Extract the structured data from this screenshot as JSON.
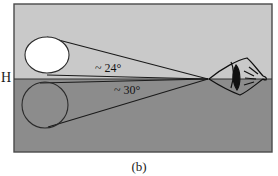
{
  "figure": {
    "caption": "(b)",
    "horizon_label": "H",
    "background_color": "#ffffff",
    "frame": {
      "x": 14,
      "y": 4,
      "width": 258,
      "height": 148,
      "border_color": "#4a4a4a",
      "sky_color": "#c9c9c9",
      "ground_color": "#8c8c8c"
    },
    "horizon": {
      "y": 79,
      "line_color": "#3a3a3a"
    },
    "vertex": {
      "x": 208,
      "y": 79
    }
  },
  "moons": {
    "zenith_moon": {
      "name": "elevated-moon",
      "cx": 47,
      "cy": 55,
      "rx": 22,
      "ry": 18,
      "fill": "#ffffff",
      "stroke": "#2b2b2b"
    },
    "horizon_moon": {
      "name": "horizon-moon",
      "cx": 45,
      "cy": 105,
      "rx": 23,
      "ry": 23,
      "fill": "none",
      "stroke": "#2b2b2b"
    }
  },
  "angles": {
    "upper": {
      "label": "~ 24°",
      "value": 24,
      "unit": "degrees"
    },
    "lower": {
      "label": "~ 30°",
      "value": 30,
      "unit": "degrees"
    }
  },
  "eye": {
    "name": "observer-eye",
    "x": 228,
    "y": 58,
    "width": 40,
    "height": 38,
    "stroke": "#101010"
  }
}
